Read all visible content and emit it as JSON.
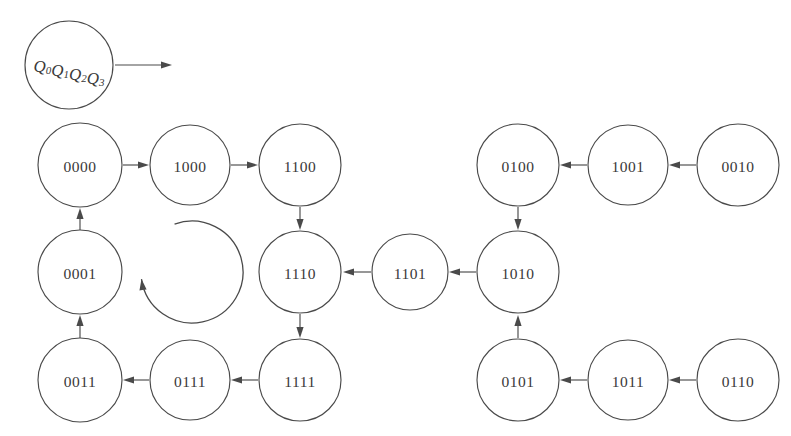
{
  "diagram": {
    "background_color": "#ffffff",
    "stroke_color": "#4a4a4a",
    "text_color": "#3a3a3a",
    "legend": {
      "label_parts": [
        "Q",
        "0",
        "Q",
        "1",
        "Q",
        "2",
        "Q",
        "3"
      ],
      "label_text": "Q0Q1Q2Q3",
      "cx": 69,
      "cy": 65,
      "r": 44,
      "arrow": {
        "x1": 115,
        "y1": 65,
        "x2": 172,
        "y2": 65
      }
    },
    "nodes": [
      {
        "id": "0000",
        "label": "0000",
        "cx": 80,
        "cy": 165,
        "r": 42
      },
      {
        "id": "1000",
        "label": "1000",
        "cx": 190,
        "cy": 165,
        "r": 40
      },
      {
        "id": "1100",
        "label": "1100",
        "cx": 300,
        "cy": 165,
        "r": 41
      },
      {
        "id": "0100",
        "label": "0100",
        "cx": 518,
        "cy": 165,
        "r": 41
      },
      {
        "id": "1001",
        "label": "1001",
        "cx": 628,
        "cy": 165,
        "r": 40
      },
      {
        "id": "0010",
        "label": "0010",
        "cx": 738,
        "cy": 165,
        "r": 41
      },
      {
        "id": "0001",
        "label": "0001",
        "cx": 80,
        "cy": 272,
        "r": 42
      },
      {
        "id": "1110",
        "label": "1110",
        "cx": 300,
        "cy": 272,
        "r": 41
      },
      {
        "id": "1101",
        "label": "1101",
        "cx": 410,
        "cy": 272,
        "r": 38
      },
      {
        "id": "1010",
        "label": "1010",
        "cx": 518,
        "cy": 272,
        "r": 41
      },
      {
        "id": "0011",
        "label": "0011",
        "cx": 80,
        "cy": 380,
        "r": 42
      },
      {
        "id": "0111",
        "label": "0111",
        "cx": 190,
        "cy": 380,
        "r": 40
      },
      {
        "id": "1111",
        "label": "1111",
        "cx": 300,
        "cy": 380,
        "r": 41
      },
      {
        "id": "0101",
        "label": "0101",
        "cx": 518,
        "cy": 380,
        "r": 41
      },
      {
        "id": "1011",
        "label": "1011",
        "cx": 628,
        "cy": 380,
        "r": 40
      },
      {
        "id": "0110",
        "label": "0110",
        "cx": 738,
        "cy": 380,
        "r": 41
      }
    ],
    "edges": [
      {
        "from": "0000",
        "to": "1000",
        "direction": "right",
        "x1": 123,
        "y1": 165,
        "x2": 149,
        "y2": 165
      },
      {
        "from": "1000",
        "to": "1100",
        "direction": "right",
        "x1": 231,
        "y1": 165,
        "x2": 258,
        "y2": 165
      },
      {
        "from": "1100",
        "to": "1110",
        "direction": "down",
        "x1": 300,
        "y1": 207,
        "x2": 300,
        "y2": 230
      },
      {
        "from": "1110",
        "to": "1111",
        "direction": "down",
        "x1": 300,
        "y1": 314,
        "x2": 300,
        "y2": 338
      },
      {
        "from": "1111",
        "to": "0111",
        "direction": "left",
        "x1": 258,
        "y1": 380,
        "x2": 231,
        "y2": 380
      },
      {
        "from": "0111",
        "to": "0011",
        "direction": "left",
        "x1": 149,
        "y1": 380,
        "x2": 123,
        "y2": 380
      },
      {
        "from": "0011",
        "to": "0001",
        "direction": "up",
        "x1": 80,
        "y1": 338,
        "x2": 80,
        "y2": 315
      },
      {
        "from": "0001",
        "to": "0000",
        "direction": "up",
        "x1": 80,
        "y1": 230,
        "x2": 80,
        "y2": 208
      },
      {
        "from": "0010",
        "to": "1001",
        "direction": "left",
        "x1": 696,
        "y1": 165,
        "x2": 669,
        "y2": 165
      },
      {
        "from": "1001",
        "to": "0100",
        "direction": "left",
        "x1": 587,
        "y1": 165,
        "x2": 560,
        "y2": 165
      },
      {
        "from": "0100",
        "to": "1010",
        "direction": "down",
        "x1": 518,
        "y1": 207,
        "x2": 518,
        "y2": 230
      },
      {
        "from": "1010",
        "to": "1101",
        "direction": "left",
        "x1": 476,
        "y1": 272,
        "x2": 449,
        "y2": 272
      },
      {
        "from": "1101",
        "to": "1110",
        "direction": "left",
        "x1": 371,
        "y1": 272,
        "x2": 343,
        "y2": 272
      },
      {
        "from": "0110",
        "to": "1011",
        "direction": "left",
        "x1": 696,
        "y1": 380,
        "x2": 669,
        "y2": 380
      },
      {
        "from": "1011",
        "to": "0101",
        "direction": "left",
        "x1": 587,
        "y1": 380,
        "x2": 560,
        "y2": 380
      },
      {
        "from": "0101",
        "to": "1010",
        "direction": "up",
        "x1": 518,
        "y1": 338,
        "x2": 518,
        "y2": 315
      }
    ],
    "cycle_arc": {
      "name": "cycle-indicator",
      "cx": 192,
      "cy": 272,
      "r": 51,
      "start_angle_deg": 250,
      "sweep_deg": 282,
      "arrow_angle_deg": 172,
      "description": "open circular arrow indicating cycle direction"
    }
  }
}
